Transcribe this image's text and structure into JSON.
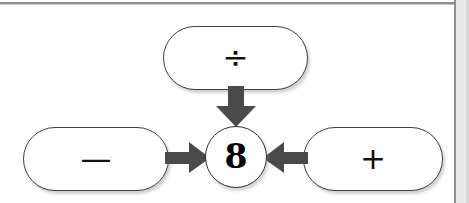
{
  "diagram": {
    "type": "concept-map",
    "center_node": {
      "name": "center-number-node",
      "value": "8",
      "shape": "circle"
    },
    "operator_nodes": [
      {
        "name": "divide-operator",
        "label": "÷",
        "icon": "divide-icon",
        "position": "top"
      },
      {
        "name": "minus-operator",
        "label": "—",
        "icon": "minus-icon",
        "position": "left"
      },
      {
        "name": "plus-operator",
        "label": "+",
        "icon": "plus-icon",
        "position": "right"
      }
    ],
    "connectors": [
      {
        "name": "arrow-divide-to-center",
        "icon": "arrow-down-icon",
        "direction": "down",
        "from": "divide-operator",
        "to": "center-number-node"
      },
      {
        "name": "arrow-minus-to-center",
        "icon": "arrow-right-icon",
        "direction": "right",
        "from": "minus-operator",
        "to": "center-number-node"
      },
      {
        "name": "arrow-plus-to-center",
        "icon": "arrow-left-icon",
        "direction": "left",
        "from": "plus-operator",
        "to": "center-number-node"
      }
    ]
  },
  "colors": {
    "background": "#ffffff",
    "node_stroke": "#3f3f3f",
    "arrow_fill": "#4a4a4a",
    "text": "#000000",
    "frame_rule": "#8e8e8e",
    "gutter": "#e9e9e9"
  }
}
